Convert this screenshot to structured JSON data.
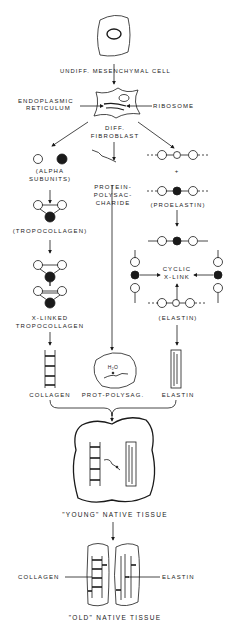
{
  "diagram": {
    "type": "flow"
  },
  "nodes": {
    "cell": {
      "label": "UNDIFF. MESENCHYMAL CELL"
    },
    "er": {
      "label_line1": "ENDOPLASMIC",
      "label_line2": "RETICULUM"
    },
    "ribosome": {
      "label": "RIBOSOME"
    },
    "fibroblast": {
      "label_line1": "DIFF.",
      "label_line2": "FIBROBLAST"
    },
    "alpha": {
      "label_line1": "(ALPHA",
      "label_line2": "SUBUNITS)",
      "glyph1": "α1",
      "glyph2": "α2"
    },
    "protein_polysac": {
      "label_line1": "PROTEIN-",
      "label_line2": "POLYSAC-",
      "label_line3": "CHARIDE"
    },
    "proelastin": {
      "label": "(PROELASTIN)",
      "plus": "+",
      "glyph": "R"
    },
    "tropocollagen": {
      "label": "(TROPOCOLLAGEN)"
    },
    "xlinked": {
      "label_line1": "X-LINKED",
      "label_line2": "TROPOCOLLAGEN"
    },
    "cyclic": {
      "label_line1": "CYCLIC",
      "label_line2": "X-LINK"
    },
    "elastin_mid": {
      "label": "(ELASTIN)"
    },
    "collagen": {
      "label": "COLLAGEN"
    },
    "prot_polysac": {
      "label": "PROT-POLYSAG.",
      "h2o": "H₂O"
    },
    "elastin": {
      "label": "ELASTIN"
    },
    "young": {
      "label": "\"YOUNG\" NATIVE TISSUE"
    },
    "old": {
      "label": "\"OLD\" NATIVE TISSUE",
      "collagen_label": "COLLAGEN",
      "elastin_label": "ELASTIN"
    }
  },
  "edges": [
    [
      "cell",
      "fibroblast"
    ],
    [
      "fibroblast",
      "alpha"
    ],
    [
      "fibroblast",
      "protein_polysac"
    ],
    [
      "fibroblast",
      "proelastin"
    ],
    [
      "alpha",
      "tropocollagen"
    ],
    [
      "tropocollagen",
      "xlinked"
    ],
    [
      "xlinked",
      "collagen"
    ],
    [
      "protein_polysac",
      "prot_polysac"
    ],
    [
      "proelastin",
      "cyclic"
    ],
    [
      "cyclic",
      "elastin_mid"
    ],
    [
      "elastin_mid",
      "elastin"
    ],
    [
      "collagen",
      "young"
    ],
    [
      "prot_polysac",
      "young"
    ],
    [
      "elastin",
      "young"
    ],
    [
      "young",
      "old"
    ]
  ]
}
